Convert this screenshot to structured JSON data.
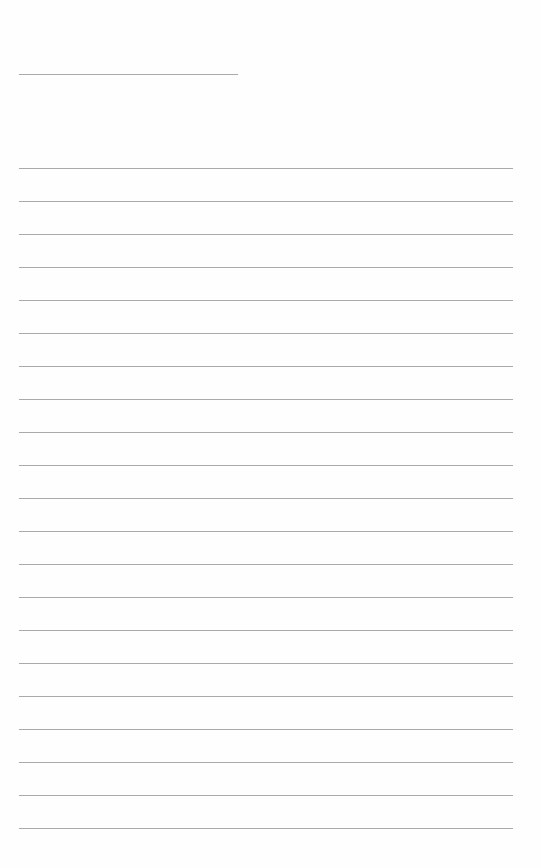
{
  "page": {
    "type": "lined-paper",
    "background_color": "#fefefe",
    "line_color": "#a9a9a9",
    "header_line": {
      "x": 19,
      "y": 74,
      "width": 219
    },
    "ruled_lines": {
      "count": 21,
      "start_y": 168,
      "spacing": 33,
      "x": 19,
      "width": 494
    }
  }
}
